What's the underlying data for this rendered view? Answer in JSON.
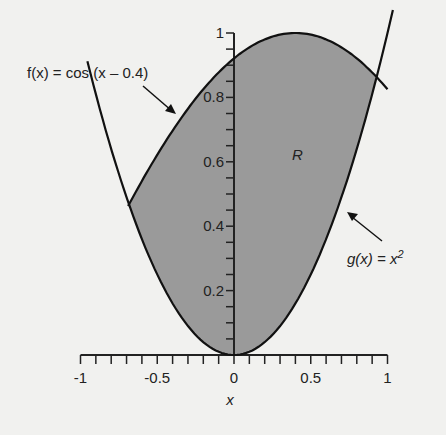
{
  "chart_data": {
    "type": "area",
    "title": "",
    "xlabel": "x",
    "ylabel": "",
    "xlim": [
      -1,
      1
    ],
    "ylim": [
      0,
      1
    ],
    "x_ticks": [
      "-1",
      "-0.5",
      "0",
      "0.5",
      "1"
    ],
    "y_ticks": [
      "0.2",
      "0.4",
      "0.6",
      "0.8",
      "1"
    ],
    "grid": false,
    "series": [
      {
        "name": "f(x) = cos (x – 0.4)",
        "function": "cos(x - 0.4)",
        "x_range": [
          -0.68,
          1.0
        ]
      },
      {
        "name": "g(x) = x²",
        "function": "x^2",
        "x_range": [
          -0.96,
          1.03
        ]
      }
    ],
    "shaded_region": {
      "label": "R",
      "between": [
        "f",
        "g"
      ],
      "x_from": -0.69,
      "x_to": 0.92
    },
    "annotations": [
      {
        "text": "f(x) = cos (x – 0.4)",
        "points_to": "f"
      },
      {
        "text": "g(x) = x²",
        "points_to": "g"
      },
      {
        "text": "R",
        "at": [
          0.33,
          0.65
        ]
      }
    ]
  },
  "labels": {
    "f_label": "f(x) = cos (x – 0.4)",
    "g_label_pre": "g(x) = x",
    "g_label_sup": "2",
    "region": "R",
    "xaxis": "x"
  }
}
